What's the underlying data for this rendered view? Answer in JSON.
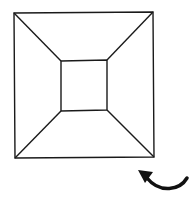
{
  "diagram": {
    "title": "",
    "stroke_color": "#1a1a1a",
    "background": "#ffffff",
    "outer_square": {
      "tl": [
        14,
        13
      ],
      "tr": [
        153,
        12
      ],
      "br": [
        154,
        157
      ],
      "bl": [
        15,
        158
      ]
    },
    "inner_square": {
      "tl": [
        61,
        61
      ],
      "tr": [
        107,
        60
      ],
      "br": [
        107,
        110
      ],
      "bl": [
        61,
        111
      ]
    },
    "connectors": [
      "top-left",
      "top-right",
      "bottom-right",
      "bottom-left"
    ],
    "arrow": {
      "icon": "curved-arrow-counterclockwise-icon",
      "direction": "left",
      "tip": [
        138,
        171
      ]
    }
  }
}
